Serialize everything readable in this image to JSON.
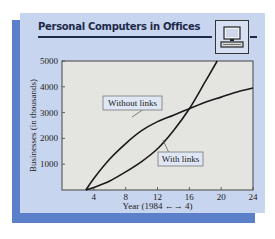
{
  "figure": {
    "title": "Personal Computers in Offices",
    "icon": "computer-icon"
  },
  "colors": {
    "card_bg": "#c8d5ee",
    "shadow": "#5b7fc8",
    "plot_bg": "#e4e4e0",
    "line": "#1a1a1a"
  },
  "chart_data": {
    "type": "line",
    "title": "Personal Computers in Offices",
    "xlabel": "Year (1984 → 4)",
    "ylabel": "Businesses (in thousands)",
    "xlim": [
      0,
      24
    ],
    "ylim": [
      0,
      5000
    ],
    "xticks": [
      4,
      8,
      12,
      16,
      20,
      24
    ],
    "yticks": [
      1000,
      2000,
      3000,
      4000,
      5000
    ],
    "grid": false,
    "series": [
      {
        "name": "Without links",
        "x": [
          3,
          4,
          6,
          8,
          10,
          12,
          14,
          16,
          18,
          20,
          22,
          24
        ],
        "values": [
          0,
          450,
          1200,
          1800,
          2300,
          2650,
          2900,
          3150,
          3400,
          3600,
          3800,
          3950
        ]
      },
      {
        "name": "With links",
        "x": [
          3,
          4,
          6,
          8,
          10,
          12,
          14,
          16,
          18,
          19.5
        ],
        "values": [
          0,
          100,
          350,
          700,
          1100,
          1600,
          2300,
          3150,
          4200,
          5000
        ]
      }
    ],
    "annotations": [
      {
        "text": "Without links",
        "points_to": "Without links",
        "x": 8,
        "y": 2500
      },
      {
        "text": "With links",
        "points_to": "With links",
        "x": 13,
        "y": 1150
      }
    ]
  }
}
